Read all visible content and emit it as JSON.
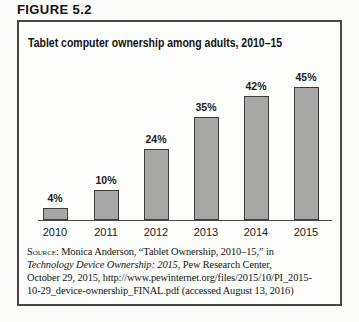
{
  "figure_label": "FIGURE 5.2",
  "chart": {
    "title": "Tablet computer ownership among adults, 2010–15"
  },
  "chart_data": {
    "type": "bar",
    "title": "Tablet computer ownership among adults, 2010–15",
    "categories": [
      "2010",
      "2011",
      "2012",
      "2013",
      "2014",
      "2015"
    ],
    "values": [
      4,
      10,
      24,
      35,
      42,
      45
    ],
    "value_labels": [
      "4%",
      "10%",
      "24%",
      "35%",
      "42%",
      "45%"
    ],
    "xlabel": "",
    "ylabel": "",
    "unit": "percent of adults",
    "ylim": [
      0,
      50
    ],
    "grid": false,
    "legend": null
  },
  "source": {
    "lines": [
      [
        {
          "text": "Source:",
          "style": "smallcaps"
        },
        {
          "text": " Monica Anderson, “Tablet Ownership, 2010–15,” in",
          "style": "normal"
        }
      ],
      [
        {
          "text": "Technology Device Ownership: 2015",
          "style": "italic"
        },
        {
          "text": ", Pew Research Center,",
          "style": "normal"
        }
      ],
      [
        {
          "text": "October 29, 2015, http://www.pewinternet.org/files/2015/10/PI_2015-",
          "style": "normal"
        }
      ],
      [
        {
          "text": "10-29_device-ownership_FINAL.pdf (accessed August 13, 2016)",
          "style": "normal"
        }
      ]
    ]
  },
  "colors": {
    "bar_fill": "#a7a7a5",
    "bar_border": "#3d3d3d",
    "box_border": "#474747",
    "axis_line": "#4a4a4a",
    "text": "#1a1a1a",
    "page_bg": "#fafaf8",
    "box_bg": "#fdfdfc"
  }
}
